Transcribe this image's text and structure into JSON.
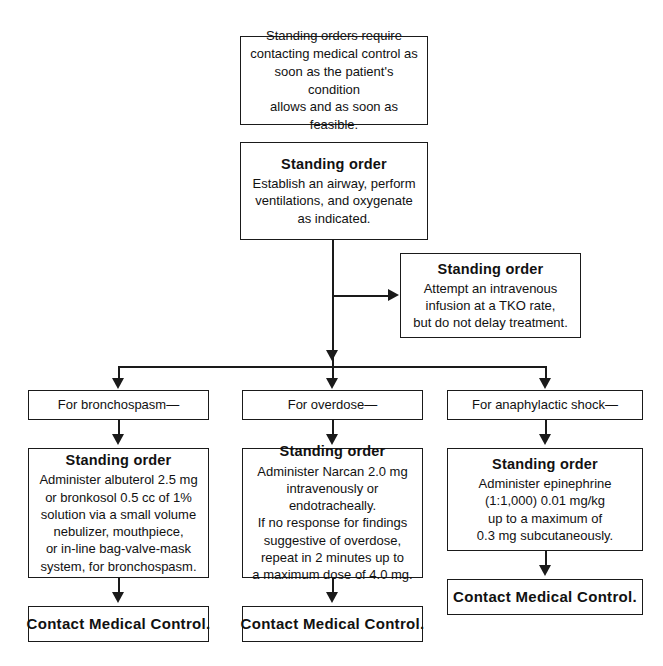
{
  "document": {
    "title": "Standing Order Flowchart",
    "line_color": "#1a1a1a",
    "box_border_color": "#1a1a1a",
    "background_color": "#ffffff"
  },
  "nodes": {
    "intro": {
      "body": "Standing orders require\ncontacting medical control as\nsoon as the patient's condition\nallows and as soon as feasible."
    },
    "airway": {
      "title": "Standing order",
      "body": "Establish an airway, perform\nventilations, and oxygenate\nas indicated."
    },
    "iv": {
      "title": "Standing order",
      "body": "Attempt an intravenous\ninfusion at a TKO rate,\nbut do not delay treatment."
    },
    "branch_bronchospasm": {
      "body": "For bronchospasm—"
    },
    "branch_overdose": {
      "body": "For overdose—"
    },
    "branch_anaphylaxis": {
      "body": "For anaphylactic shock—"
    },
    "order_bronchospasm": {
      "title": "Standing order",
      "body": "Administer albuterol 2.5 mg\nor bronkosol 0.5 cc of 1%\nsolution via a small volume\nnebulizer, mouthpiece,\nor in-line bag-valve-mask\nsystem, for bronchospasm."
    },
    "order_overdose": {
      "title": "Standing order",
      "body": "Administer Narcan 2.0 mg\nintravenously or endotracheally.\nIf no response for findings\nsuggestive of overdose,\nrepeat in 2 minutes up to\na maximum dose of 4.0 mg."
    },
    "order_anaphylaxis": {
      "title": "Standing order",
      "body": "Administer epinephrine\n(1:1,000) 0.01 mg/kg\nup to a maximum of\n0.3 mg subcutaneously."
    },
    "contact_left": {
      "title": "Contact Medical Control."
    },
    "contact_middle": {
      "title": "Contact Medical Control."
    },
    "contact_right": {
      "title": "Contact Medical Control."
    }
  }
}
